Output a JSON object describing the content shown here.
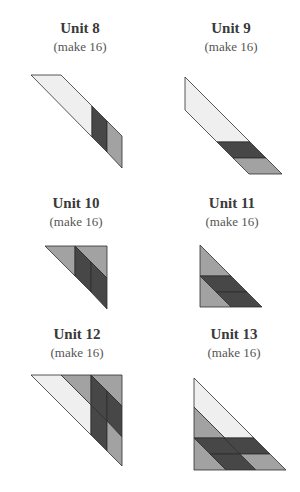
{
  "colors": {
    "light": "#efefef",
    "medium": "#a2a2a2",
    "dark": "#474747",
    "outline": "#2e2e2e"
  },
  "units": [
    {
      "title": "Unit 8",
      "subtitle": "(make 16)"
    },
    {
      "title": "Unit 9",
      "subtitle": "(make 16)"
    },
    {
      "title": "Unit 10",
      "subtitle": "(make 16)"
    },
    {
      "title": "Unit 11",
      "subtitle": "(make 16)"
    },
    {
      "title": "Unit 12",
      "subtitle": "(make 16)"
    },
    {
      "title": "Unit 13",
      "subtitle": "(make 16)"
    }
  ]
}
